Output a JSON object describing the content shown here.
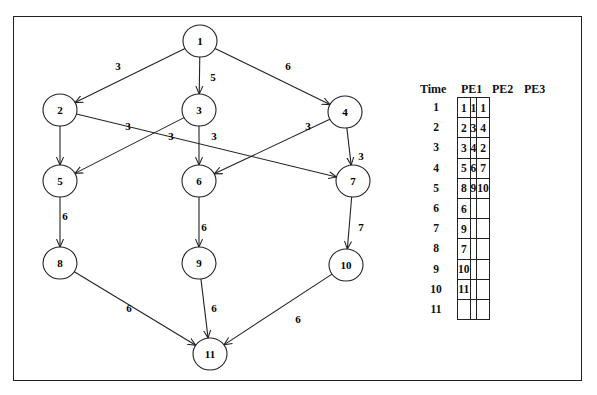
{
  "graph": {
    "nodes": [
      {
        "id": "1",
        "x": 200,
        "y": 41
      },
      {
        "id": "2",
        "x": 60,
        "y": 110
      },
      {
        "id": "3",
        "x": 199,
        "y": 110
      },
      {
        "id": "4",
        "x": 345,
        "y": 112
      },
      {
        "id": "5",
        "x": 60,
        "y": 181
      },
      {
        "id": "6",
        "x": 199,
        "y": 181
      },
      {
        "id": "7",
        "x": 353,
        "y": 181
      },
      {
        "id": "8",
        "x": 60,
        "y": 263
      },
      {
        "id": "9",
        "x": 199,
        "y": 263
      },
      {
        "id": "10",
        "x": 346,
        "y": 265
      },
      {
        "id": "11",
        "x": 210,
        "y": 354
      }
    ],
    "edges": [
      {
        "from": "1",
        "to": "2",
        "weight": "3",
        "lx": 118,
        "ly": 66
      },
      {
        "from": "1",
        "to": "3",
        "weight": "5",
        "lx": 213,
        "ly": 77
      },
      {
        "from": "1",
        "to": "4",
        "weight": "6",
        "lx": 288,
        "ly": 66
      },
      {
        "from": "2",
        "to": "5",
        "weight": "",
        "lx": 0,
        "ly": 0
      },
      {
        "from": "2",
        "to": "7",
        "weight": "3",
        "lx": 128,
        "ly": 126
      },
      {
        "from": "3",
        "to": "5",
        "weight": "3",
        "lx": 171,
        "ly": 136
      },
      {
        "from": "3",
        "to": "6",
        "weight": "3",
        "lx": 214,
        "ly": 136
      },
      {
        "from": "4",
        "to": "6",
        "weight": "3",
        "lx": 308,
        "ly": 126
      },
      {
        "from": "4",
        "to": "7",
        "weight": "3",
        "lx": 361,
        "ly": 156
      },
      {
        "from": "5",
        "to": "8",
        "weight": "6",
        "lx": 65,
        "ly": 216
      },
      {
        "from": "6",
        "to": "9",
        "weight": "6",
        "lx": 204,
        "ly": 227
      },
      {
        "from": "7",
        "to": "10",
        "weight": "7",
        "lx": 361,
        "ly": 227
      },
      {
        "from": "8",
        "to": "11",
        "weight": "6",
        "lx": 129,
        "ly": 308
      },
      {
        "from": "9",
        "to": "11",
        "weight": "6",
        "lx": 214,
        "ly": 308
      },
      {
        "from": "10",
        "to": "11",
        "weight": "6",
        "lx": 298,
        "ly": 319
      }
    ]
  },
  "schedule": {
    "headers": {
      "time": "Time",
      "pe1": "PE1",
      "pe2": "PE2",
      "pe3": "PE3"
    },
    "rows": [
      {
        "time": "1",
        "pe1": "1",
        "pe2": "1",
        "pe3": "1"
      },
      {
        "time": "2",
        "pe1": "2",
        "pe2": "3",
        "pe3": "4"
      },
      {
        "time": "3",
        "pe1": "3",
        "pe2": "4",
        "pe3": "2"
      },
      {
        "time": "4",
        "pe1": "5",
        "pe2": "6",
        "pe3": "7"
      },
      {
        "time": "5",
        "pe1": "8",
        "pe2": "9",
        "pe3": "10"
      },
      {
        "time": "6",
        "pe1": "6",
        "pe2": "",
        "pe3": ""
      },
      {
        "time": "7",
        "pe1": "9",
        "pe2": "",
        "pe3": ""
      },
      {
        "time": "8",
        "pe1": "7",
        "pe2": "",
        "pe3": ""
      },
      {
        "time": "9",
        "pe1": "10",
        "pe2": "",
        "pe3": ""
      },
      {
        "time": "10",
        "pe1": "11",
        "pe2": "",
        "pe3": ""
      },
      {
        "time": "11",
        "pe1": "",
        "pe2": "",
        "pe3": ""
      }
    ]
  }
}
